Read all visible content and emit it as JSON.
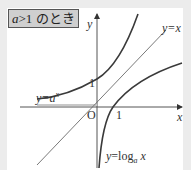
{
  "title": {
    "var": "a",
    "rest": ">1 のとき"
  },
  "axes": {
    "x_label": "x",
    "y_label": "y",
    "origin_label": "O",
    "y_tick_label": "1",
    "x_tick_label": "1"
  },
  "curves": {
    "exponential": {
      "label_prefix": "y=a",
      "label_sup": "x"
    },
    "identity": {
      "label": "y=x"
    },
    "logarithm": {
      "label_prefix": "y=log",
      "label_sub": "a",
      "label_suffix": " x"
    }
  },
  "colors": {
    "curve": "#3a3a3a",
    "line": "#6a6a6a",
    "axis": "#555555",
    "title_bg": "#cfcfcf"
  }
}
